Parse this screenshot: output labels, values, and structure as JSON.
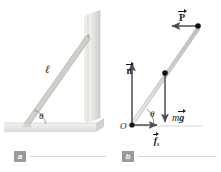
{
  "figure": {
    "background_color": "#ffffff"
  },
  "panel_a": {
    "caption_letter": "a",
    "length_label": "ℓ",
    "angle_label": "θ",
    "objects": {
      "ladder": "ladder",
      "wall": "vertical-wall",
      "floor": "horizontal-floor"
    },
    "colors": {
      "ladder_light": "#e8e8e4",
      "ladder_mid": "#c9c9c4",
      "wall": "#e4e4e2",
      "floor": "#ededea"
    }
  },
  "panel_b": {
    "caption_letter": "b",
    "origin_label": "O",
    "angle_label": "θ",
    "forces": [
      {
        "id": "normal",
        "symbol": "n",
        "subscript": "",
        "direction": "up",
        "description": "normal force from floor"
      },
      {
        "id": "friction",
        "symbol": "f",
        "subscript": "s",
        "direction": "right",
        "description": "static friction force from floor"
      },
      {
        "id": "weight",
        "symbol": "g",
        "prefix": "m",
        "subscript": "",
        "direction": "down",
        "description": "gravitational force at center of mass"
      },
      {
        "id": "applied",
        "symbol": "P",
        "subscript": "",
        "direction": "left",
        "description": "applied force at top of ladder"
      }
    ],
    "labels": {
      "normal": "n",
      "friction": "f",
      "friction_sub": "s",
      "weight_m": "m",
      "weight_g": "g",
      "applied": "P"
    },
    "colors": {
      "vector": "#4d4d4d",
      "ladder": "#cfcfc9",
      "dot": "#000000"
    }
  }
}
